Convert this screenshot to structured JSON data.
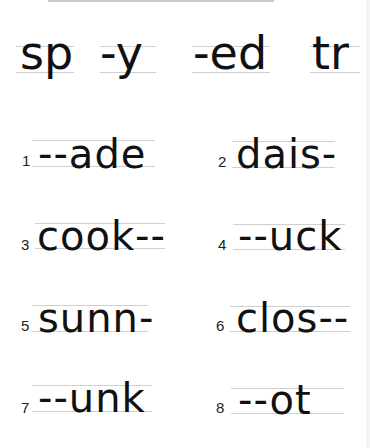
{
  "worksheet": {
    "header_options": [
      "sp",
      "-y",
      "-ed",
      "tr"
    ],
    "items": [
      {
        "number": "1",
        "text": "--ade"
      },
      {
        "number": "2",
        "text": "dais-"
      },
      {
        "number": "3",
        "text": "cook--"
      },
      {
        "number": "4",
        "text": "--uck"
      },
      {
        "number": "5",
        "text": "sunn-"
      },
      {
        "number": "6",
        "text": "clos--"
      },
      {
        "number": "7",
        "text": "--unk"
      },
      {
        "number": "8",
        "text": "--ot"
      }
    ]
  }
}
